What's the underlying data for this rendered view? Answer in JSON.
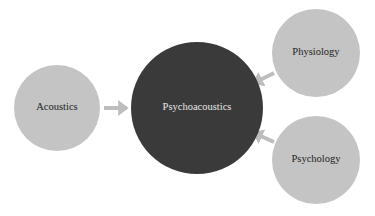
{
  "diagram": {
    "center": {
      "label": "Psychoacoustics",
      "fill": "#3a3a3a",
      "text_color": "#e8e8e8"
    },
    "sources": [
      {
        "id": "acoustics",
        "label": "Acoustics"
      },
      {
        "id": "physiology",
        "label": "Physiology"
      },
      {
        "id": "psychology",
        "label": "Psychology"
      }
    ],
    "colors": {
      "node_fill": "#c4c4c4",
      "arrow": "#bdbdbd",
      "text": "#222222"
    }
  }
}
